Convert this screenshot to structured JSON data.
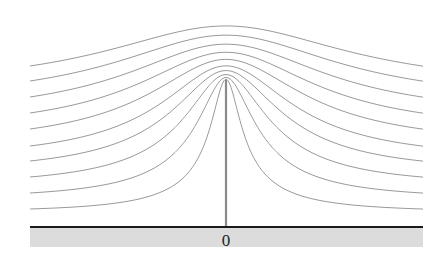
{
  "diagram": {
    "title": "",
    "origin_label": "0",
    "colors": {
      "streamline": "#9a9a9a",
      "plate": "#8a8a8a",
      "wall": "#1a1a1a",
      "ground": "#dcdcdc",
      "background": "#ffffff"
    },
    "geometry": {
      "x_left": 30,
      "x_right": 423,
      "x_center": 226,
      "baseline_y": 227,
      "ground_bottom_y": 247,
      "plate_top_y": 80
    },
    "streamline_far_heights": [
      18,
      34,
      50,
      66,
      81,
      98,
      114,
      130,
      146,
      161
    ],
    "streamline_count": 10
  }
}
